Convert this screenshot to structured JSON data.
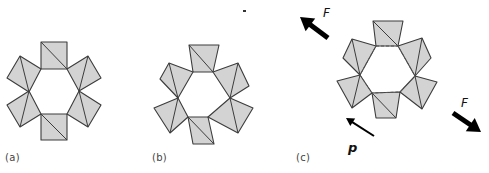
{
  "figure": {
    "panels": [
      {
        "id": "a",
        "label": "(a)",
        "label_pos": [
          5,
          152
        ],
        "tiles": [
          {
            "pts": [
              [
                41,
                42
              ],
              [
                67,
                42
              ],
              [
                67,
                69
              ],
              [
                41,
                69
              ]
            ],
            "diag": [
              [
                41,
                42
              ],
              [
                67,
                69
              ]
            ]
          },
          {
            "pts": [
              [
                20,
                56
              ],
              [
                41,
                69
              ],
              [
                29,
                92
              ],
              [
                7,
                78
              ]
            ],
            "diag": [
              [
                20,
                56
              ],
              [
                29,
                92
              ]
            ]
          },
          {
            "pts": [
              [
                29,
                91
              ],
              [
                41,
                114
              ],
              [
                20,
                127
              ],
              [
                7,
                105
              ]
            ],
            "diag": [
              [
                29,
                91
              ],
              [
                20,
                127
              ]
            ]
          },
          {
            "pts": [
              [
                41,
                114
              ],
              [
                67,
                114
              ],
              [
                67,
                140
              ],
              [
                41,
                140
              ]
            ],
            "diag": [
              [
                41,
                114
              ],
              [
                67,
                140
              ]
            ]
          },
          {
            "pts": [
              [
                88,
                56
              ],
              [
                101,
                78
              ],
              [
                79,
                91
              ],
              [
                67,
                69
              ]
            ],
            "diag": [
              [
                88,
                56
              ],
              [
                79,
                91
              ]
            ]
          },
          {
            "pts": [
              [
                79,
                91
              ],
              [
                101,
                105
              ],
              [
                88,
                127
              ],
              [
                67,
                114
              ]
            ],
            "diag": [
              [
                79,
                91
              ],
              [
                88,
                127
              ]
            ]
          }
        ]
      },
      {
        "id": "b",
        "label": "(b)",
        "label_pos": [
          152,
          152
        ],
        "tiles": [
          {
            "pts": [
              [
                189,
                45
              ],
              [
                219,
                45
              ],
              [
                213,
                72
              ],
              [
                193,
                72
              ]
            ],
            "diag": [
              [
                189,
                45
              ],
              [
                213,
                72
              ]
            ]
          },
          {
            "pts": [
              [
                169,
                63
              ],
              [
                193,
                72
              ],
              [
                178,
                98
              ],
              [
                160,
                79
              ]
            ],
            "diag": [
              [
                169,
                63
              ],
              [
                178,
                98
              ]
            ]
          },
          {
            "pts": [
              [
                178,
                98
              ],
              [
                188,
                117
              ],
              [
                170,
                133
              ],
              [
                154,
                108
              ]
            ],
            "diag": [
              [
                178,
                98
              ],
              [
                170,
                133
              ]
            ]
          },
          {
            "pts": [
              [
                188,
                117
              ],
              [
                208,
                117
              ],
              [
                214,
                144
              ],
              [
                193,
                144
              ]
            ],
            "diag": [
              [
                188,
                117
              ],
              [
                214,
                144
              ]
            ]
          },
          {
            "pts": [
              [
                238,
                63
              ],
              [
                249,
                86
              ],
              [
                230,
                98
              ],
              [
                213,
                72
              ]
            ],
            "diag": [
              [
                238,
                63
              ],
              [
                230,
                98
              ]
            ]
          },
          {
            "pts": [
              [
                230,
                98
              ],
              [
                253,
                108
              ],
              [
                238,
                133
              ],
              [
                208,
                117
              ]
            ],
            "diag": [
              [
                230,
                98
              ],
              [
                238,
                133
              ]
            ]
          }
        ]
      },
      {
        "id": "c",
        "label": "(c)",
        "label_pos": [
          296,
          152
        ],
        "tiles": [
          {
            "pts": [
              [
                373,
                21
              ],
              [
                403,
                21
              ],
              [
                398,
                46
              ],
              [
                376,
                46
              ]
            ],
            "diag": [
              [
                373,
                21
              ],
              [
                398,
                46
              ]
            ]
          },
          {
            "pts": [
              [
                352,
                39
              ],
              [
                376,
                46
              ],
              [
                360,
                75
              ],
              [
                343,
                58
              ]
            ],
            "diag": [
              [
                352,
                39
              ],
              [
                360,
                75
              ]
            ]
          },
          {
            "pts": [
              [
                360,
                75
              ],
              [
                372,
                93
              ],
              [
                352,
                108
              ],
              [
                337,
                81
              ]
            ],
            "diag": [
              [
                360,
                75
              ],
              [
                352,
                108
              ]
            ]
          },
          {
            "pts": [
              [
                372,
                93
              ],
              [
                400,
                92
              ],
              [
                396,
                118
              ],
              [
                376,
                118
              ]
            ],
            "diag": [
              [
                372,
                93
              ],
              [
                396,
                118
              ]
            ]
          },
          {
            "pts": [
              [
                422,
                38
              ],
              [
                431,
                58
              ],
              [
                415,
                76
              ],
              [
                398,
                46
              ]
            ],
            "diag": [
              [
                422,
                38
              ],
              [
                415,
                76
              ]
            ]
          },
          {
            "pts": [
              [
                415,
                76
              ],
              [
                437,
                82
              ],
              [
                422,
                109
              ],
              [
                400,
                92
              ]
            ],
            "diag": [
              [
                415,
                76
              ],
              [
                422,
                109
              ]
            ]
          }
        ],
        "dashed_ring": [
          [
            376,
            46
          ],
          [
            398,
            46
          ],
          [
            415,
            76
          ],
          [
            400,
            92
          ],
          [
            372,
            93
          ],
          [
            360,
            75
          ]
        ],
        "vectors": [
          {
            "name": "F",
            "label": "F",
            "role": "force",
            "from": [
              328,
              38
            ],
            "to": [
              300,
              17
            ],
            "width": 5,
            "label_pos": [
              323,
              6
            ]
          },
          {
            "name": "F",
            "label": "F",
            "role": "force",
            "from": [
              453,
              113
            ],
            "to": [
              481,
              132
            ],
            "width": 5,
            "label_pos": [
              461,
              96
            ]
          },
          {
            "name": "p",
            "label": "p",
            "role": "polarization",
            "from": [
              374,
              136
            ],
            "to": [
              346,
              118
            ],
            "width": 2,
            "label_pos": [
              348,
              140
            ]
          }
        ]
      }
    ],
    "stray_mark": [
      243,
      10
    ],
    "colors": {
      "tile_fill": "#d3d3d3",
      "tile_stroke": "#3c3c3c",
      "arrow": "#000000",
      "background": "#ffffff"
    }
  }
}
